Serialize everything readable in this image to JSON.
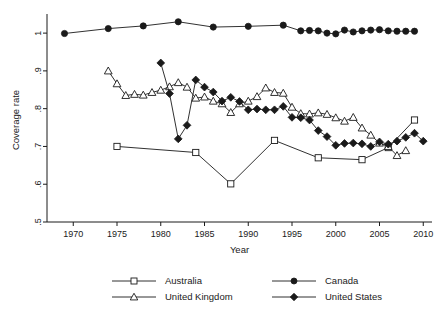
{
  "chart_data": {
    "type": "line",
    "title": "",
    "xlabel": "Year",
    "ylabel": "Coverage rate",
    "xlim": [
      1967,
      2011
    ],
    "ylim": [
      0.5,
      1.04
    ],
    "xticks": [
      1970,
      1975,
      1980,
      1985,
      1990,
      1995,
      2000,
      2005,
      2010
    ],
    "xtick_labels": [
      "1970",
      "1975",
      "1980",
      "1985",
      "1990",
      "1995",
      "2000",
      "2005",
      "2010"
    ],
    "yticks": [
      0.5,
      0.6,
      0.7,
      0.8,
      0.9,
      1.0
    ],
    "ytick_labels": [
      ".5",
      ".6",
      ".7",
      ".8",
      ".9",
      "1"
    ],
    "grid": false,
    "legend_position": "bottom",
    "series": [
      {
        "name": "Australia",
        "marker": "open-square",
        "x": [
          1975,
          1984,
          1988,
          1993,
          1998,
          2003,
          2006,
          2009
        ],
        "y": [
          0.7,
          0.684,
          0.601,
          0.716,
          0.67,
          0.665,
          0.697,
          0.77
        ]
      },
      {
        "name": "Canada",
        "marker": "filled-circle",
        "x": [
          1969,
          1974,
          1978,
          1982,
          1986,
          1990,
          1994,
          1996,
          1997,
          1998,
          1999,
          2000,
          2001,
          2002,
          2003,
          2004,
          2005,
          2006,
          2007,
          2008,
          2009
        ],
        "y": [
          0.999,
          1.012,
          1.019,
          1.03,
          1.016,
          1.018,
          1.021,
          1.006,
          1.007,
          1.006,
          1.0,
          0.998,
          1.008,
          1.003,
          1.006,
          1.008,
          1.009,
          1.006,
          1.005,
          1.005,
          1.005
        ]
      },
      {
        "name": "United Kingdom",
        "marker": "open-triangle",
        "x": [
          1974,
          1975,
          1976,
          1977,
          1978,
          1979,
          1980,
          1981,
          1982,
          1983,
          1984,
          1985,
          1986,
          1987,
          1988,
          1989,
          1990,
          1991,
          1992,
          1993,
          1994,
          1995,
          1996,
          1997,
          1998,
          1999,
          2000,
          2001,
          2002,
          2003,
          2004,
          2005,
          2006,
          2007,
          2008
        ],
        "y": [
          0.9,
          0.866,
          0.835,
          0.838,
          0.836,
          0.843,
          0.849,
          0.858,
          0.869,
          0.857,
          0.828,
          0.831,
          0.82,
          0.813,
          0.79,
          0.813,
          0.82,
          0.832,
          0.855,
          0.843,
          0.841,
          0.804,
          0.787,
          0.786,
          0.789,
          0.785,
          0.776,
          0.767,
          0.777,
          0.749,
          0.73,
          0.709,
          0.7,
          0.676,
          0.689
        ]
      },
      {
        "name": "United States",
        "marker": "filled-diamond",
        "x": [
          1980,
          1981,
          1982,
          1983,
          1984,
          1985,
          1986,
          1987,
          1988,
          1989,
          1990,
          1991,
          1992,
          1993,
          1994,
          1995,
          1996,
          1997,
          1998,
          1999,
          2000,
          2001,
          2002,
          2003,
          2004,
          2005,
          2006,
          2007,
          2008,
          2009,
          2010
        ],
        "y": [
          0.921,
          0.84,
          0.72,
          0.756,
          0.876,
          0.857,
          0.844,
          0.82,
          0.83,
          0.819,
          0.797,
          0.799,
          0.797,
          0.797,
          0.806,
          0.777,
          0.776,
          0.77,
          0.742,
          0.726,
          0.703,
          0.708,
          0.709,
          0.707,
          0.7,
          0.712,
          0.706,
          0.714,
          0.724,
          0.735,
          0.714
        ]
      }
    ]
  },
  "legend": {
    "entries": [
      {
        "label": "Australia",
        "marker": "open-square"
      },
      {
        "label": "Canada",
        "marker": "filled-circle"
      },
      {
        "label": "United Kingdom",
        "marker": "open-triangle"
      },
      {
        "label": "United States",
        "marker": "filled-diamond"
      }
    ]
  },
  "colors": {
    "ink": "#1a1a1a",
    "background": "#ffffff"
  }
}
